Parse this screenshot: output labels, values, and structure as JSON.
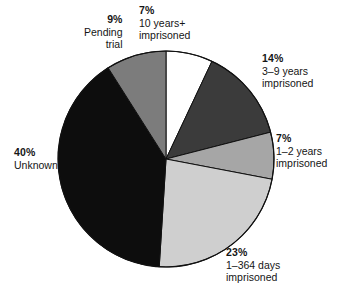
{
  "chart_data": {
    "type": "pie",
    "title": "",
    "subtitle": "",
    "xlabel": "",
    "ylabel": "",
    "legend_position": "callouts",
    "grid": false,
    "start_angle_deg": 0,
    "direction": "clockwise",
    "total_percent": 100,
    "categories": [
      "10 years+ imprisoned",
      "3–9 years imprisoned",
      "1–2 years imprisoned",
      "1–364 days imprisoned",
      "Unknown",
      "Pending trial"
    ],
    "values": [
      7,
      14,
      7,
      23,
      40,
      9
    ],
    "slices": [
      {
        "id": "ten-years-plus",
        "percent_label": "7%",
        "value": 7,
        "desc_lines": [
          "10 years+",
          "imprisoned"
        ],
        "color": "#ffffff",
        "start_deg": 0,
        "end_deg": 25.2
      },
      {
        "id": "three-to-nine-years",
        "percent_label": "14%",
        "value": 14,
        "desc_lines": [
          "3–9 years",
          "imprisoned"
        ],
        "color": "#3b3b3b",
        "start_deg": 25.2,
        "end_deg": 75.6
      },
      {
        "id": "one-to-two-years",
        "percent_label": "7%",
        "value": 7,
        "desc_lines": [
          "1–2 years",
          "imprisoned"
        ],
        "color": "#a6a6a6",
        "start_deg": 75.6,
        "end_deg": 100.8
      },
      {
        "id": "one-to-364-days",
        "percent_label": "23%",
        "value": 23,
        "desc_lines": [
          "1–364 days",
          "imprisoned"
        ],
        "color": "#cfcfcf",
        "start_deg": 100.8,
        "end_deg": 183.6
      },
      {
        "id": "unknown",
        "percent_label": "40%",
        "value": 40,
        "desc_lines": [
          "Unknown"
        ],
        "color": "#0d0d0d",
        "start_deg": 183.6,
        "end_deg": 327.6
      },
      {
        "id": "pending-trial",
        "percent_label": "9%",
        "value": 9,
        "desc_lines": [
          "Pending",
          "trial"
        ],
        "color": "#7c7c7c",
        "start_deg": 327.6,
        "end_deg": 360
      }
    ],
    "geometry": {
      "center_x": 166,
      "center_y": 159,
      "radius": 108,
      "stroke_color": "#111111",
      "stroke_width": 1
    }
  },
  "callouts": {
    "pending_trial": {
      "pct": "9%",
      "line1": "Pending",
      "line2": "trial"
    },
    "ten_years_plus": {
      "pct": "7%",
      "line1": "10 years+",
      "line2": "imprisoned"
    },
    "three_nine_years": {
      "pct": "14%",
      "line1": "3–9 years",
      "line2": "imprisoned"
    },
    "one_two_years": {
      "pct": "7%",
      "line1": "1–2 years",
      "line2": "imprisoned"
    },
    "unknown": {
      "pct": "40%",
      "line1": "Unknown",
      "line2": ""
    },
    "one_364_days": {
      "pct": "23%",
      "line1": "1–364 days",
      "line2": "imprisoned"
    }
  }
}
